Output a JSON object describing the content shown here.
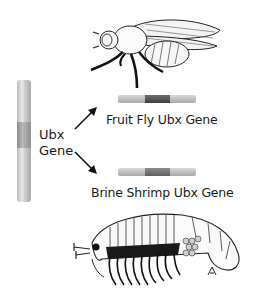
{
  "figure": {
    "source_label": "Ubx\nGene",
    "source_label_line1": "Ubx",
    "source_label_line2": "Gene",
    "targets": [
      {
        "label": "Fruit Fly Ubx Gene",
        "organism": "fruit fly",
        "icon": "fruit-fly-illustration"
      },
      {
        "label": "Brine Shrimp Ubx Gene",
        "organism": "brine shrimp",
        "icon": "brine-shrimp-illustration"
      }
    ],
    "colors": {
      "chromosome_light": "#d6d6d6",
      "chromosome_band": "#9a9a9a",
      "gene_dark_segment": "#4a4a4a",
      "text": "#1a1a1a",
      "background": "#ffffff"
    }
  }
}
